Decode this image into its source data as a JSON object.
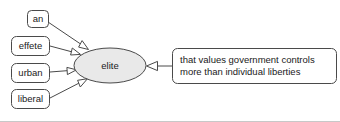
{
  "diagram": {
    "type": "concept-definition-graph",
    "background_color": "#ffffff",
    "node_stroke_color": "#4a4a4a",
    "ellipse_fill_color": "#e9e9e9",
    "rect_fill_color": "#ffffff",
    "arrow_fill_color": "#ffffff",
    "center_node": {
      "label": "elite",
      "shape": "ellipse"
    },
    "modifiers": [
      {
        "label": "an",
        "shape": "rounded-rect"
      },
      {
        "label": "effete",
        "shape": "rounded-rect"
      },
      {
        "label": "urban",
        "shape": "rounded-rect"
      },
      {
        "label": "liberal",
        "shape": "rounded-rect"
      }
    ],
    "definition": {
      "shape": "rounded-rect",
      "line1": "that values government controls",
      "line2": "more than individual liberties"
    }
  }
}
